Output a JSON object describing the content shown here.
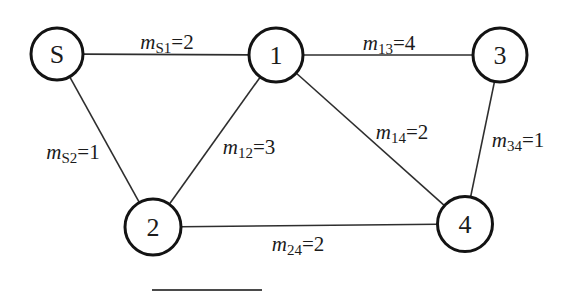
{
  "diagram": {
    "type": "undirected-weighted-graph",
    "background": "#ffffff",
    "node_fill": "#ffffff",
    "node_border_color": "#131313",
    "node_border_width": 3,
    "edge_color": "#2e2e2e",
    "edge_width": 1.6,
    "text_color": "#1b1b1b",
    "node_font_size": 26,
    "label_font_size": 21,
    "label_sub_font_size": 15,
    "nodes": [
      {
        "id": "S",
        "label": "S",
        "x": 57,
        "y": 54,
        "r": 26
      },
      {
        "id": "1",
        "label": "1",
        "x": 276,
        "y": 55,
        "r": 27
      },
      {
        "id": "3",
        "label": "3",
        "x": 500,
        "y": 55,
        "r": 27
      },
      {
        "id": "2",
        "label": "2",
        "x": 153,
        "y": 227,
        "r": 28
      },
      {
        "id": "4",
        "label": "4",
        "x": 465,
        "y": 224,
        "r": 27.5
      }
    ],
    "edges": [
      {
        "from": "S",
        "to": "1",
        "symbol": "m",
        "sub": "S1",
        "value": "2",
        "label_x": 167,
        "label_y": 49
      },
      {
        "from": "1",
        "to": "3",
        "symbol": "m",
        "sub": "13",
        "value": "4",
        "label_x": 389,
        "label_y": 50
      },
      {
        "from": "S",
        "to": "2",
        "symbol": "m",
        "sub": "S2",
        "value": "1",
        "label_x": 73,
        "label_y": 159
      },
      {
        "from": "1",
        "to": "2",
        "symbol": "m",
        "sub": "12",
        "value": "3",
        "label_x": 249,
        "label_y": 154
      },
      {
        "from": "1",
        "to": "4",
        "symbol": "m",
        "sub": "14",
        "value": "2",
        "label_x": 402,
        "label_y": 139
      },
      {
        "from": "3",
        "to": "4",
        "symbol": "m",
        "sub": "34",
        "value": "1",
        "label_x": 518,
        "label_y": 147
      },
      {
        "from": "2",
        "to": "4",
        "symbol": "m",
        "sub": "24",
        "value": "2",
        "label_x": 298,
        "label_y": 251
      }
    ],
    "cropped_rule": {
      "x": 152,
      "y": 290,
      "width": 110,
      "color": "#4a4a4a",
      "stroke_width": 2
    }
  }
}
